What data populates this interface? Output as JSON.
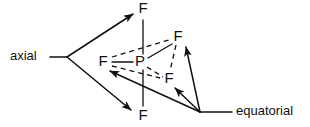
{
  "diagram": {
    "colors": {
      "ink": "#101010",
      "background": "#ffffff"
    },
    "center_atom": {
      "label": "P",
      "x": 140,
      "y": 62
    },
    "atoms": [
      {
        "id": "f-axial-top",
        "label": "F",
        "x": 143,
        "y": 9,
        "position_type": "axial"
      },
      {
        "id": "f-axial-bottom",
        "label": "F",
        "x": 143,
        "y": 116,
        "position_type": "axial"
      },
      {
        "id": "f-equatorial-left",
        "label": "F",
        "x": 103,
        "y": 62,
        "position_type": "equatorial"
      },
      {
        "id": "f-equatorial-upper-right",
        "label": "F",
        "x": 178,
        "y": 37,
        "position_type": "equatorial"
      },
      {
        "id": "f-equatorial-lower-right",
        "label": "F",
        "x": 169,
        "y": 79,
        "position_type": "equatorial"
      }
    ],
    "bonds": [
      {
        "id": "bond-p-f-axial-top",
        "style": "solid",
        "x1": 143,
        "y1": 20,
        "x2": 143,
        "y2": 54
      },
      {
        "id": "bond-p-f-axial-bottom",
        "style": "solid",
        "x1": 143,
        "y1": 70,
        "x2": 143,
        "y2": 106
      },
      {
        "id": "bond-p-f-eq-left",
        "style": "solid",
        "x1": 112,
        "y1": 62,
        "x2": 133,
        "y2": 62
      },
      {
        "id": "bond-p-f-eq-upper-right",
        "style": "solid",
        "x1": 148,
        "y1": 58,
        "x2": 172,
        "y2": 44
      },
      {
        "id": "bond-p-f-eq-lower-right",
        "style": "dashed",
        "x1": 147,
        "y1": 67,
        "x2": 163,
        "y2": 77
      }
    ],
    "equatorial_plane_edges": [
      {
        "id": "plane-edge-left-to-upper-right",
        "style": "dashed",
        "x1": 112,
        "y1": 57,
        "x2": 172,
        "y2": 39
      },
      {
        "id": "plane-edge-left-to-lower-right",
        "style": "dashed",
        "x1": 112,
        "y1": 66,
        "x2": 160,
        "y2": 78
      },
      {
        "id": "plane-edge-upper-right-to-lower-right",
        "style": "dashed",
        "x1": 176,
        "y1": 45,
        "x2": 170,
        "y2": 71
      }
    ],
    "annotations": [
      {
        "id": "axial-annotation",
        "label": "axial",
        "label_x": 10,
        "label_y": 57,
        "stem": {
          "x1": 50,
          "y1": 57,
          "x2": 67,
          "y2": 57
        },
        "arrows": [
          {
            "id": "axial-arrow-to-top-f",
            "x1": 67,
            "y1": 57,
            "x2": 133,
            "y2": 14
          },
          {
            "id": "axial-arrow-to-bottom-f",
            "x1": 67,
            "y1": 57,
            "x2": 131,
            "y2": 110
          }
        ]
      },
      {
        "id": "equatorial-annotation",
        "label": "equatorial",
        "label_x": 236,
        "label_y": 112,
        "stem": {
          "x1": 200,
          "y1": 112,
          "x2": 232,
          "y2": 112
        },
        "arrows": [
          {
            "id": "equatorial-arrow-to-left-f",
            "x1": 200,
            "y1": 112,
            "x2": 110,
            "y2": 71
          },
          {
            "id": "equatorial-arrow-to-lower-right-f",
            "x1": 200,
            "y1": 112,
            "x2": 175,
            "y2": 88
          },
          {
            "id": "equatorial-arrow-to-upper-right-f",
            "x1": 200,
            "y1": 112,
            "x2": 186,
            "y2": 47
          }
        ]
      }
    ]
  }
}
